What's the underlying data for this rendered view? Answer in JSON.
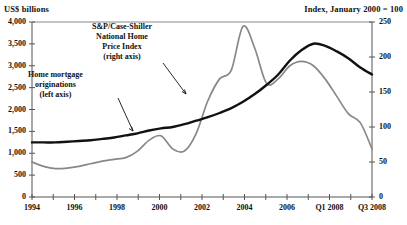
{
  "chart_data": {
    "type": "line",
    "title": "",
    "xlabel": "",
    "left_axis_title": "US$ billions",
    "right_axis_title": "Index, January 2000 = 100",
    "x_tick_labels": [
      "1994",
      "1996",
      "1998",
      "2000",
      "2002",
      "2004",
      "2006",
      "Q1 2008",
      "Q3 2008"
    ],
    "y_left_ticks": [
      "0",
      "500",
      "1,000",
      "1,500",
      "2,000",
      "2,500",
      "3,000",
      "3,500",
      "4,000"
    ],
    "y_right_ticks": [
      "0",
      "50",
      "100",
      "150",
      "200",
      "250"
    ],
    "ylim_left": [
      0,
      4000
    ],
    "ylim_right": [
      0,
      250
    ],
    "grid": false,
    "legend_position": "inline-annotations",
    "annotations": [
      {
        "name": "case-shiller-annotation",
        "lines": [
          "S&P/Case-Shiller",
          "National Home",
          "Price Index",
          "(right axis)"
        ]
      },
      {
        "name": "originations-annotation",
        "lines": [
          "Home mortgage",
          "originations",
          "(left axis)"
        ]
      }
    ],
    "series": [
      {
        "name": "Home mortgage originations (left axis)",
        "axis": "left",
        "color": "#888888",
        "x": [
          1994,
          1994.5,
          1995,
          1995.5,
          1996,
          1996.5,
          1997,
          1997.5,
          1998,
          1998.5,
          1999,
          1999.5,
          2000,
          2000.5,
          2001,
          2001.5,
          2002,
          2002.5,
          2003,
          2003.5,
          2004,
          2004.5,
          2005,
          2005.5,
          2006,
          2006.5,
          2007,
          2007.5,
          2008,
          2008.5
        ],
        "values": [
          800,
          700,
          650,
          660,
          700,
          760,
          820,
          860,
          900,
          1050,
          1300,
          1400,
          1100,
          1050,
          1450,
          2200,
          2700,
          2900,
          3900,
          3400,
          2600,
          2700,
          3000,
          3100,
          3000,
          2700,
          2300,
          1900,
          1700,
          1100
        ]
      },
      {
        "name": "S&P/Case-Shiller National Home Price Index (right axis)",
        "axis": "right",
        "color": "#111111",
        "x": [
          1994,
          1994.5,
          1995,
          1995.5,
          1996,
          1996.5,
          1997,
          1997.5,
          1998,
          1998.5,
          1999,
          1999.5,
          2000,
          2000.5,
          2001,
          2001.5,
          2002,
          2002.5,
          2003,
          2003.5,
          2004,
          2004.5,
          2005,
          2005.5,
          2006,
          2006.5,
          2007,
          2007.5,
          2008,
          2008.5
        ],
        "values": [
          78,
          78,
          78,
          79,
          80,
          81,
          83,
          85,
          88,
          91,
          95,
          98,
          100,
          104,
          109,
          114,
          120,
          127,
          136,
          147,
          160,
          175,
          195,
          210,
          219,
          216,
          208,
          198,
          185,
          175
        ]
      }
    ]
  }
}
